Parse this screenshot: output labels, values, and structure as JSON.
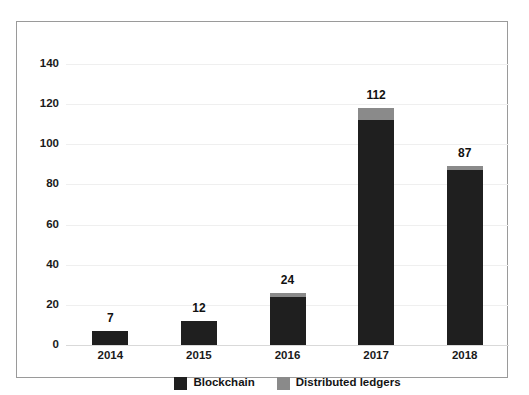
{
  "chart_data": {
    "type": "bar",
    "stacked": true,
    "title": "",
    "subtitle": "",
    "xlabel": "",
    "ylabel": "",
    "categories": [
      "2014",
      "2015",
      "2016",
      "2017",
      "2018"
    ],
    "series": [
      {
        "name": "Blockchain",
        "color": "#1f1f1f",
        "values": [
          7,
          12,
          24,
          112,
          87
        ]
      },
      {
        "name": "Distributed ledgers",
        "color": "#8a8a8a",
        "values": [
          0,
          0,
          2,
          6,
          2
        ]
      }
    ],
    "data_labels": [
      "7",
      "12",
      "24",
      "112",
      "87"
    ],
    "ylim": [
      0,
      140
    ],
    "yticks": [
      0,
      20,
      40,
      60,
      80,
      100,
      120,
      140
    ],
    "ytick_labels": [
      "0",
      "20",
      "40",
      "60",
      "80",
      "100",
      "120",
      "140"
    ],
    "grid": true,
    "legend_position": "bottom",
    "legend": [
      "Blockchain",
      "Distributed ledgers"
    ]
  },
  "colors": {
    "primary": "#1f1f1f",
    "secondary": "#8a8a8a",
    "frame": "#9a9a9a",
    "gridline": "#efefef",
    "baseline": "#d9d9d9",
    "text": "#1a1a1a",
    "background": "#ffffff"
  }
}
